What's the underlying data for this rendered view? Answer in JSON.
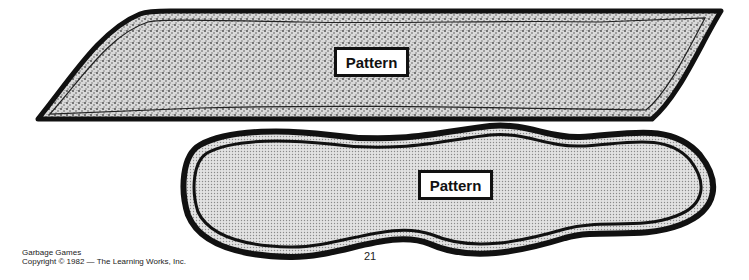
{
  "shapes": [
    {
      "id": "top-pattern",
      "label": "Pattern",
      "fill": "stipple"
    },
    {
      "id": "bottom-pattern",
      "label": "Pattern",
      "fill": "dot-screen"
    }
  ],
  "footer": {
    "title": "Garbage Games",
    "copyright": "Copyright © 1982 — The Learning Works, Inc."
  },
  "page_number": "21",
  "colors": {
    "ink": "#111111",
    "paper": "#ffffff"
  }
}
